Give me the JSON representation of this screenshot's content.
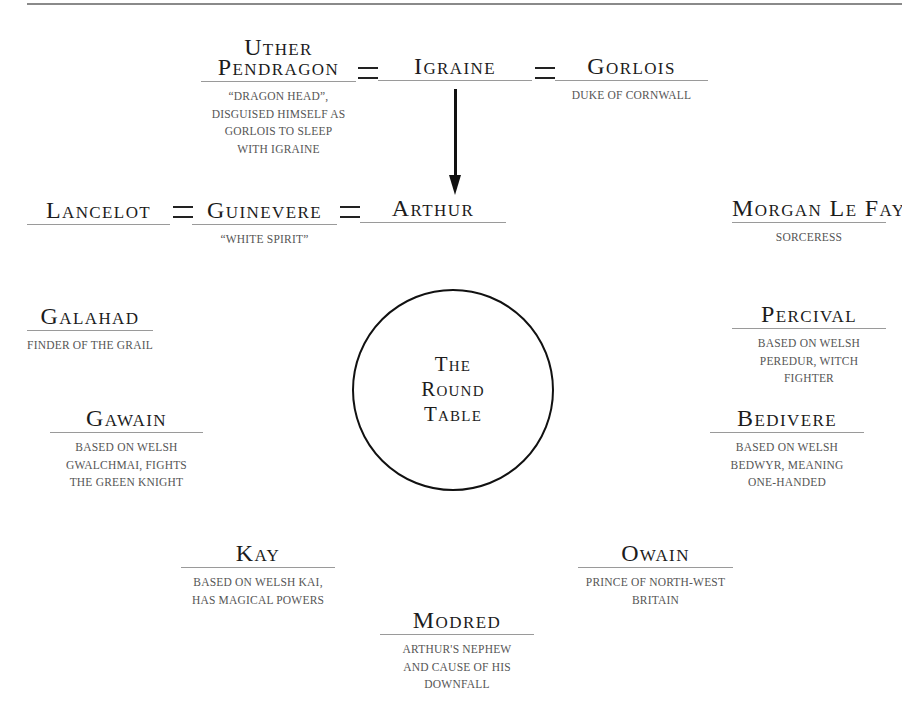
{
  "diagram": {
    "title": "The Round Table",
    "circle_label_lines": [
      "The",
      "Round",
      "Table"
    ],
    "symbols": {
      "marriage": "=",
      "child_of": "arrow-down"
    },
    "people": {
      "uther": {
        "name_lines": [
          "Uther",
          "Pendragon"
        ],
        "desc_lines": [
          "“Dragon head”,",
          "disguised himself as",
          "Gorlois to sleep",
          "with Igraine"
        ]
      },
      "igraine": {
        "name_lines": [
          "Igraine"
        ],
        "desc_lines": []
      },
      "gorlois": {
        "name_lines": [
          "Gorlois"
        ],
        "desc_lines": [
          "Duke of Cornwall"
        ]
      },
      "lancelot": {
        "name_lines": [
          "Lancelot"
        ],
        "desc_lines": []
      },
      "guinevere": {
        "name_lines": [
          "Guinevere"
        ],
        "desc_lines": [
          "“White spirit”"
        ]
      },
      "arthur": {
        "name_lines": [
          "Arthur"
        ],
        "desc_lines": []
      },
      "morgan": {
        "name_lines": [
          "Morgan Le Fay"
        ],
        "desc_lines": [
          "Sorceress"
        ]
      },
      "galahad": {
        "name_lines": [
          "Galahad"
        ],
        "desc_lines": [
          "Finder of the Grail"
        ]
      },
      "percival": {
        "name_lines": [
          "Percival"
        ],
        "desc_lines": [
          "Based on Welsh",
          "Peredur, witch",
          "fighter"
        ]
      },
      "gawain": {
        "name_lines": [
          "Gawain"
        ],
        "desc_lines": [
          "Based on Welsh",
          "Gwalchmai, fights",
          "the Green Knight"
        ]
      },
      "bedivere": {
        "name_lines": [
          "Bedivere"
        ],
        "desc_lines": [
          "Based on Welsh",
          "Bedwyr, meaning",
          "one-handed"
        ]
      },
      "kay": {
        "name_lines": [
          "Kay"
        ],
        "desc_lines": [
          "Based on Welsh Kai,",
          "has magical powers"
        ]
      },
      "owain": {
        "name_lines": [
          "Owain"
        ],
        "desc_lines": [
          "Prince of North-West",
          "Britain"
        ]
      },
      "modred": {
        "name_lines": [
          "Modred"
        ],
        "desc_lines": [
          "Arthur's nephew",
          "and cause of his",
          "downfall"
        ]
      }
    },
    "relationships": [
      {
        "type": "marriage",
        "from": "Uther Pendragon",
        "to": "Igraine"
      },
      {
        "type": "marriage",
        "from": "Igraine",
        "to": "Gorlois"
      },
      {
        "type": "child",
        "parent": "Igraine",
        "child": "Arthur"
      },
      {
        "type": "marriage",
        "from": "Lancelot",
        "to": "Guinevere"
      },
      {
        "type": "marriage",
        "from": "Guinevere",
        "to": "Arthur"
      }
    ],
    "colors": {
      "text": "#1c1c1c",
      "description": "#555555",
      "rule": "#9a9a9a",
      "background": "#ffffff"
    }
  }
}
